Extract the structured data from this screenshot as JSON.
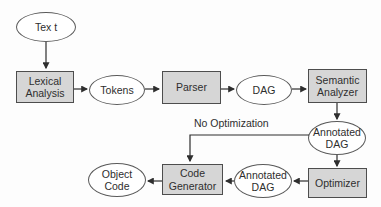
{
  "diagram": {
    "type": "flowchart",
    "nodes": [
      {
        "id": "text",
        "shape": "ellipse",
        "label": "Tex t"
      },
      {
        "id": "lexical-analysis",
        "shape": "rectangle",
        "label": "Lexical Analysis"
      },
      {
        "id": "tokens",
        "shape": "ellipse",
        "label": "Tokens"
      },
      {
        "id": "parser",
        "shape": "rectangle",
        "label": "Parser"
      },
      {
        "id": "dag",
        "shape": "ellipse",
        "label": "DAG"
      },
      {
        "id": "semantic-analyzer",
        "shape": "rectangle",
        "label": "Semantic Analyzer"
      },
      {
        "id": "annotated-dag-top",
        "shape": "ellipse",
        "label": "Annotated DAG"
      },
      {
        "id": "optimizer",
        "shape": "rectangle",
        "label": "Optimizer"
      },
      {
        "id": "annotated-dag-bottom",
        "shape": "ellipse",
        "label": "Annotated DAG"
      },
      {
        "id": "code-generator",
        "shape": "rectangle",
        "label": "Code Generator"
      },
      {
        "id": "object-code",
        "shape": "ellipse",
        "label": "Object Code"
      }
    ],
    "edges": [
      {
        "from": "text",
        "to": "lexical-analysis"
      },
      {
        "from": "lexical-analysis",
        "to": "tokens"
      },
      {
        "from": "tokens",
        "to": "parser"
      },
      {
        "from": "parser",
        "to": "dag"
      },
      {
        "from": "dag",
        "to": "semantic-analyzer"
      },
      {
        "from": "semantic-analyzer",
        "to": "annotated-dag-top"
      },
      {
        "from": "annotated-dag-top",
        "to": "optimizer"
      },
      {
        "from": "optimizer",
        "to": "annotated-dag-bottom"
      },
      {
        "from": "annotated-dag-bottom",
        "to": "code-generator"
      },
      {
        "from": "code-generator",
        "to": "object-code"
      },
      {
        "from": "annotated-dag-top",
        "to": "code-generator",
        "label": "No Optimization"
      }
    ],
    "edge_labels": {
      "no_optimization": "No Optimization"
    },
    "colors": {
      "rect_fill": "#d6d6d6",
      "rect_border": "#4d4d4d",
      "ellipse_fill": "#ffffff",
      "ellipse_border": "#5a5a5a",
      "line": "#2e2e2e",
      "text": "#2e2e2e",
      "background": "#fdfdfd"
    }
  }
}
